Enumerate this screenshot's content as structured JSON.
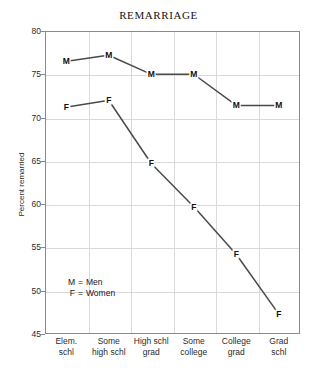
{
  "chart_data": {
    "type": "line",
    "title": "REMARRIAGE",
    "xlabel": "",
    "ylabel": "Percent remarried",
    "ylim": [
      45,
      80
    ],
    "yticks": [
      45,
      50,
      55,
      60,
      65,
      70,
      75,
      80
    ],
    "grid": true,
    "legend_position": "inside-lower-left",
    "categories": [
      "Elem.\nschl",
      "Some\nhigh schl",
      "High schl\ngrad",
      "Some\ncollege",
      "College\ngrad",
      "Grad\nschl"
    ],
    "category_lines": [
      [
        "Elem.",
        "schl"
      ],
      [
        "Some",
        "high schl"
      ],
      [
        "High schl",
        "grad"
      ],
      [
        "Some",
        "college"
      ],
      [
        "College",
        "grad"
      ],
      [
        "Grad",
        "schl"
      ]
    ],
    "series": [
      {
        "name": "Men",
        "key": "M",
        "values": [
          76.5,
          77.2,
          75.0,
          75.0,
          71.4,
          71.4
        ]
      },
      {
        "name": "Women",
        "key": "F",
        "values": [
          71.2,
          72.0,
          64.7,
          59.7,
          54.2,
          47.3
        ]
      }
    ],
    "line_color": "#4a4a4a",
    "grid_color": "#d9d9d9",
    "frame_color": "#8a8a8a"
  },
  "legend": {
    "rows": [
      {
        "key": "M",
        "eq": "=",
        "label": "Men"
      },
      {
        "key": "F",
        "eq": "=",
        "label": "Women"
      }
    ]
  }
}
